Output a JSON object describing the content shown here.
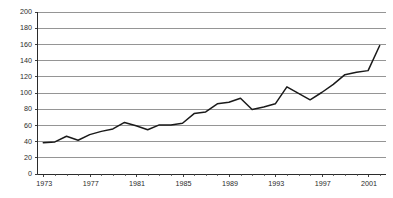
{
  "chart_data": {
    "type": "line",
    "title": "",
    "subtitle": "",
    "xlabel": "",
    "ylabel": "",
    "xlim": [
      1972.5,
      2002.5
    ],
    "ylim": [
      0,
      200
    ],
    "grid": true,
    "legend": false,
    "legend_position": "none",
    "series_color": "#1a1a1a",
    "gridline_color": "#8a8a8a",
    "axis_color": "#2b2b2b",
    "y_ticks": [
      0,
      20,
      40,
      60,
      80,
      100,
      120,
      140,
      160,
      180,
      200
    ],
    "y_tick_labels": [
      "0",
      "20",
      "40",
      "60",
      "80",
      "100",
      "120",
      "140",
      "160",
      "180",
      "200"
    ],
    "x_ticks": [
      1973,
      1974,
      1975,
      1976,
      1977,
      1978,
      1979,
      1980,
      1981,
      1982,
      1983,
      1984,
      1985,
      1986,
      1987,
      1988,
      1989,
      1990,
      1991,
      1992,
      1993,
      1994,
      1995,
      1996,
      1997,
      1998,
      1999,
      2000,
      2001,
      2002
    ],
    "x_tick_labels_shown": [
      "1973",
      "1977",
      "1981",
      "1985",
      "1989",
      "1993",
      "1997",
      "2001"
    ],
    "x_labeled_ticks": [
      1973,
      1977,
      1981,
      1985,
      1989,
      1993,
      1997,
      2001
    ],
    "x": [
      1973,
      1974,
      1975,
      1976,
      1977,
      1978,
      1979,
      1980,
      1981,
      1982,
      1983,
      1984,
      1985,
      1986,
      1987,
      1988,
      1989,
      1990,
      1991,
      1992,
      1993,
      1994,
      1995,
      1996,
      1997,
      1998,
      1999,
      2000,
      2001,
      2002
    ],
    "values": [
      38,
      39,
      46,
      41,
      48,
      52,
      55,
      63,
      59,
      54,
      60,
      60,
      62,
      74,
      76,
      86,
      88,
      93,
      79,
      82,
      86,
      107,
      99,
      91,
      100,
      110,
      122,
      125,
      127,
      158
    ],
    "series": [
      {
        "name": "series-1",
        "values": [
          38,
          39,
          46,
          41,
          48,
          52,
          55,
          63,
          59,
          54,
          60,
          60,
          62,
          74,
          76,
          86,
          88,
          93,
          79,
          82,
          86,
          107,
          99,
          91,
          100,
          110,
          122,
          125,
          127,
          158
        ]
      }
    ],
    "annotations": []
  }
}
